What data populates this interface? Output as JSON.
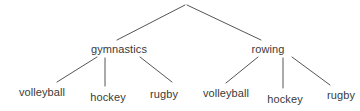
{
  "diagram": {
    "type": "tree",
    "title": "",
    "background_color": "#ffffff",
    "text_color": "#3a3a3a",
    "edge_color": "#555555",
    "edge_width": 1,
    "font_size_px": 11,
    "root": {
      "label": "",
      "x": 186,
      "y": 4
    },
    "nodes": [
      {
        "id": "gymnastics",
        "label": "gymnastics",
        "level": 1,
        "x": 119,
        "y": 49
      },
      {
        "id": "rowing",
        "label": "rowing",
        "level": 1,
        "x": 268,
        "y": 49
      },
      {
        "id": "volleyball-left",
        "label": "volleyball",
        "level": 2,
        "x": 42,
        "y": 92
      },
      {
        "id": "hockey-left",
        "label": "hockey",
        "level": 2,
        "x": 108,
        "y": 97
      },
      {
        "id": "rugby-left",
        "label": "rugby",
        "level": 2,
        "x": 164,
        "y": 94
      },
      {
        "id": "volleyball-right",
        "label": "volleyball",
        "level": 2,
        "x": 226,
        "y": 93
      },
      {
        "id": "hockey-right",
        "label": "hockey",
        "level": 2,
        "x": 285,
        "y": 99
      },
      {
        "id": "rugby-right",
        "label": "rugby",
        "level": 2,
        "x": 341,
        "y": 95
      }
    ],
    "edges": [
      {
        "from": "root",
        "to": "gymnastics",
        "x1": 185,
        "y1": 5,
        "x2": 117,
        "y2": 40
      },
      {
        "from": "root",
        "to": "rowing",
        "x1": 187,
        "y1": 5,
        "x2": 261,
        "y2": 40
      },
      {
        "from": "gymnastics",
        "to": "volleyball-left",
        "x1": 97,
        "y1": 57,
        "x2": 57,
        "y2": 82
      },
      {
        "from": "gymnastics",
        "to": "hockey-left",
        "x1": 105,
        "y1": 58,
        "x2": 105,
        "y2": 86
      },
      {
        "from": "gymnastics",
        "to": "rugby-left",
        "x1": 140,
        "y1": 57,
        "x2": 172,
        "y2": 82
      },
      {
        "from": "rowing",
        "to": "volleyball-right",
        "x1": 258,
        "y1": 57,
        "x2": 226,
        "y2": 83
      },
      {
        "from": "rowing",
        "to": "hockey-right",
        "x1": 283,
        "y1": 58,
        "x2": 283,
        "y2": 88
      },
      {
        "from": "rowing",
        "to": "rugby-right",
        "x1": 292,
        "y1": 57,
        "x2": 330,
        "y2": 85
      }
    ]
  }
}
